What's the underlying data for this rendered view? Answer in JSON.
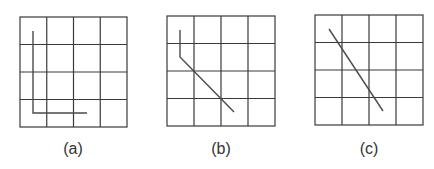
{
  "figure": {
    "panels": [
      {
        "id": "a",
        "label": "(a)",
        "grid": {
          "x": 20,
          "y": 17,
          "w": 107,
          "h": 110,
          "rows": 4,
          "cols": 4
        },
        "path": [
          [
            33,
            31
          ],
          [
            33,
            113
          ],
          [
            87,
            113
          ]
        ],
        "label_x": 53
      },
      {
        "id": "b",
        "label": "(b)",
        "grid": {
          "x": 167,
          "y": 16,
          "w": 108,
          "h": 110,
          "rows": 4,
          "cols": 4
        },
        "path": [
          [
            180,
            30
          ],
          [
            180,
            57
          ],
          [
            234,
            112
          ]
        ],
        "label_x": 201
      },
      {
        "id": "c",
        "label": "(c)",
        "grid": {
          "x": 315,
          "y": 15,
          "w": 108,
          "h": 110,
          "rows": 4,
          "cols": 4
        },
        "path": [
          [
            329,
            29
          ],
          [
            383,
            111
          ]
        ],
        "label_x": 349
      }
    ],
    "colors": {
      "grid": "#3a3a3a",
      "path": "#4a4a4a",
      "label": "#333333"
    }
  }
}
